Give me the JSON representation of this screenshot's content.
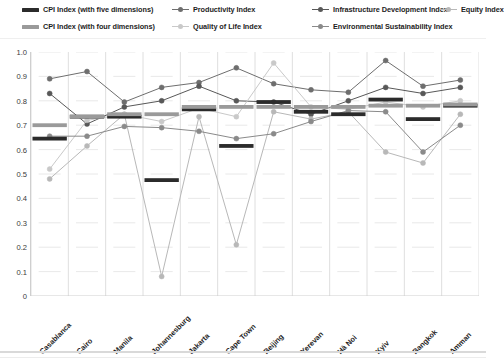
{
  "legend": {
    "rows": [
      [
        {
          "label": "CPI Index (with five dimensions)",
          "marker": "bar",
          "color": "#2b2b2b",
          "name": "legend-cpi-five"
        },
        {
          "label": "Productivity Index",
          "marker": "line",
          "color": "#6e6e6e",
          "name": "legend-productivity"
        },
        {
          "label": "Infrastructure Development Index",
          "marker": "line",
          "color": "#585858",
          "name": "legend-infrastructure"
        },
        {
          "label": "Equity Index",
          "marker": "line",
          "color": "#b8b8b8",
          "name": "legend-equity"
        }
      ],
      [
        {
          "label": "CPI Index (with four dimensions)",
          "marker": "bar",
          "color": "#9a9a9a",
          "name": "legend-cpi-four"
        },
        {
          "label": "Quality of Life Index",
          "marker": "line",
          "color": "#c9c9c9",
          "name": "legend-quality-of-life"
        },
        {
          "label": "Environmental Sustainability Index",
          "marker": "line",
          "color": "#8a8a8a",
          "name": "legend-environmental"
        }
      ]
    ]
  },
  "chart_data": {
    "type": "line",
    "title": "",
    "xlabel": "",
    "ylabel": "",
    "ylim": [
      0,
      1.0
    ],
    "grid": true,
    "legend_position": "top",
    "categories": [
      "Casablanca",
      "Cairo",
      "Manila",
      "Johannesburg",
      "Jakarta",
      "Cape Town",
      "Beijing",
      "Yerevan",
      "Hà Noi",
      "Kyiv",
      "Bangkok",
      "Amman"
    ],
    "yticks": [
      "0",
      "0.1",
      "0.2",
      "0.3",
      "0.4",
      "0.5",
      "0.6",
      "0.7",
      "0.8",
      "0.9",
      "1.0"
    ],
    "ytick_values": [
      0,
      0.1,
      0.2,
      0.3,
      0.4,
      0.5,
      0.6,
      0.7,
      0.8,
      0.9,
      1.0
    ],
    "series": [
      {
        "name": "CPI Index (with five dimensions)",
        "style": "bar",
        "color": "#2b2b2b",
        "values": [
          0.645,
          0.735,
          0.735,
          0.475,
          0.765,
          0.615,
          0.795,
          0.755,
          0.745,
          0.805,
          0.725,
          0.78
        ]
      },
      {
        "name": "CPI Index (with four dimensions)",
        "style": "bar",
        "color": "#9a9a9a",
        "values": [
          0.7,
          0.735,
          0.745,
          0.745,
          0.775,
          0.775,
          0.775,
          0.775,
          0.775,
          0.78,
          0.78,
          0.785
        ]
      },
      {
        "name": "Productivity Index",
        "style": "line",
        "color": "#6e6e6e",
        "values": [
          0.89,
          0.92,
          0.795,
          0.855,
          0.875,
          0.935,
          0.87,
          0.845,
          0.835,
          0.965,
          0.86,
          0.885
        ]
      },
      {
        "name": "Infrastructure Development Index",
        "style": "line",
        "color": "#585858",
        "values": [
          0.83,
          0.705,
          0.775,
          0.8,
          0.86,
          0.8,
          0.795,
          0.745,
          0.8,
          0.855,
          0.83,
          0.855
        ]
      },
      {
        "name": "Equity Index",
        "style": "line",
        "color": "#b8b8b8",
        "values": [
          0.48,
          0.615,
          0.745,
          0.08,
          0.735,
          0.21,
          0.755,
          0.725,
          0.755,
          0.59,
          0.545,
          0.745
        ]
      },
      {
        "name": "Quality of Life Index",
        "style": "line",
        "color": "#c9c9c9",
        "values": [
          0.52,
          0.72,
          0.745,
          0.715,
          0.77,
          0.735,
          0.955,
          0.775,
          0.765,
          0.795,
          0.775,
          0.8
        ]
      },
      {
        "name": "Environmental Sustainability Index",
        "style": "line",
        "color": "#8a8a8a",
        "values": [
          0.655,
          0.655,
          0.695,
          0.69,
          0.675,
          0.645,
          0.665,
          0.715,
          0.76,
          0.755,
          0.59,
          0.7
        ]
      }
    ]
  }
}
